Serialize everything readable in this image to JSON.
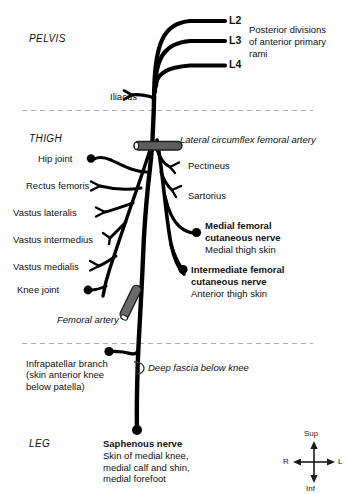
{
  "figure": {
    "regions": [
      {
        "name": "pelvis",
        "label": "PELVIS"
      },
      {
        "name": "thigh",
        "label": "THIGH"
      },
      {
        "name": "leg",
        "label": "LEG"
      }
    ],
    "roots": [
      {
        "name": "l2",
        "label": "L2"
      },
      {
        "name": "l3",
        "label": "L3"
      },
      {
        "name": "l4",
        "label": "L4"
      }
    ],
    "root_note": "Posterior divisions\nof anterior primary\nrami",
    "arteries": [
      {
        "name": "lateral-circumflex-femoral-artery",
        "label": "Lateral circumflex femoral artery"
      },
      {
        "name": "femoral-artery",
        "label": "Femoral artery"
      }
    ],
    "fascia_note": "Deep fascia below knee",
    "branches_left": [
      {
        "name": "iliacus",
        "label": "Iliacus"
      },
      {
        "name": "hip-joint",
        "label": "Hip joint"
      },
      {
        "name": "rectus-femoris",
        "label": "Rectus femoris"
      },
      {
        "name": "vastus-lateralis",
        "label": "Vastus lateralis"
      },
      {
        "name": "vastus-intermedius",
        "label": "Vastus intermedius"
      },
      {
        "name": "vastus-medialis",
        "label": "Vastus medialis"
      },
      {
        "name": "knee-joint",
        "label": "Knee joint"
      }
    ],
    "branches_right": [
      {
        "name": "pectineus",
        "label": "Pectineus"
      },
      {
        "name": "sartorius",
        "label": "Sartorius"
      }
    ],
    "cutaneous_nerves": [
      {
        "name": "medial-femoral-cutaneous-nerve",
        "title": "Medial femoral\ncutaneous nerve",
        "supply": "Medial thigh skin"
      },
      {
        "name": "intermediate-femoral-cutaneous-nerve",
        "title": "Intermediate femoral\ncutaneous nerve",
        "supply": "Anterior thigh skin"
      }
    ],
    "infrapatellar": {
      "name": "infrapatellar-branch",
      "title": "Infrapatellar branch",
      "detail": "(skin anterior knee\nbelow patella)"
    },
    "saphenous": {
      "name": "saphenous-nerve",
      "title": "Saphenous nerve",
      "supply": "Skin of medial knee,\nmedial calf and shin,\nmedial forefoot"
    },
    "compass": {
      "sup": "Sup",
      "inf": "Inf",
      "left": "R",
      "right": "L"
    },
    "colors": {
      "nerve": "#000000",
      "artery": "#5a5a5a",
      "artery_outline": "#1a1a1a",
      "divider": "#b0a9a0",
      "text": "#111111",
      "background": "#ffffff"
    }
  }
}
